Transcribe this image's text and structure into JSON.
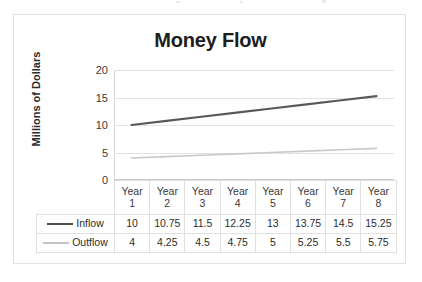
{
  "chart_data": {
    "type": "line",
    "title": "Money Flow",
    "xlabel": "",
    "ylabel": "Millions of Dollars",
    "categories": [
      "Year 1",
      "Year 2",
      "Year 3",
      "Year 4",
      "Year 5",
      "Year 6",
      "Year 7",
      "Year 8"
    ],
    "category_lines": [
      [
        "Year",
        "1"
      ],
      [
        "Year",
        "2"
      ],
      [
        "Year",
        "3"
      ],
      [
        "Year",
        "4"
      ],
      [
        "Year",
        "5"
      ],
      [
        "Year",
        "6"
      ],
      [
        "Year",
        "7"
      ],
      [
        "Year",
        "8"
      ]
    ],
    "series": [
      {
        "name": "Inflow",
        "color": "#595959",
        "values": [
          10,
          10.75,
          11.5,
          12.25,
          13,
          13.75,
          14.5,
          15.25
        ],
        "labels": [
          "10",
          "10.75",
          "11.5",
          "12.25",
          "13",
          "13.75",
          "14.5",
          "15.25"
        ]
      },
      {
        "name": "Outflow",
        "color": "#c9c9c9",
        "values": [
          4,
          4.25,
          4.5,
          4.75,
          5,
          5.25,
          5.5,
          5.75
        ],
        "labels": [
          "4",
          "4.25",
          "4.5",
          "4.75",
          "5",
          "5.25",
          "5.5",
          "5.75"
        ]
      }
    ],
    "ylim": [
      0,
      20
    ],
    "yticks": [
      0,
      5,
      10,
      15,
      20
    ],
    "ytick_labels": [
      "0",
      "5",
      "10",
      "15",
      "20"
    ],
    "grid": true,
    "legend_position": "data-table-left",
    "data_table_visible": true
  }
}
